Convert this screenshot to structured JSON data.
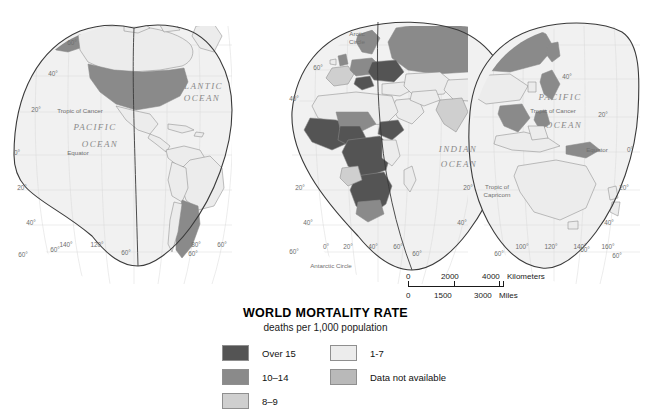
{
  "title": "WORLD MORTALITY RATE",
  "subtitle": "deaths per 1,000 population",
  "legend": {
    "left_column": [
      {
        "label": "Over 15",
        "color": "#545454"
      },
      {
        "label": "10–14",
        "color": "#8a8a8a"
      },
      {
        "label": "8–9",
        "color": "#cfcfcf"
      }
    ],
    "right_column": [
      {
        "label": "1-7",
        "color": "#ececec"
      },
      {
        "label": "Data not available",
        "color": "#b9b9b9"
      }
    ]
  },
  "scale_bar": {
    "km": {
      "ticks": [
        "0",
        "2000",
        "4000"
      ],
      "unit": "Kilometers"
    },
    "mi": {
      "ticks": [
        "0",
        "1500",
        "3000"
      ],
      "unit": "Miles"
    }
  },
  "map": {
    "ocean_color": "#f1f1f1",
    "outline_color": "#3a3a3a",
    "graticule_color": "#d4d4d4",
    "border_color": "#8c8c8c",
    "ocean_labels": [
      {
        "text": "ATLANTIC",
        "x": 197,
        "y": 89
      },
      {
        "text": "OCEAN",
        "x": 202,
        "y": 101
      },
      {
        "text": "PACIFIC",
        "x": 95,
        "y": 130
      },
      {
        "text": "OCEAN",
        "x": 100,
        "y": 147
      },
      {
        "text": "INDIAN",
        "x": 458,
        "y": 152
      },
      {
        "text": "OCEAN",
        "x": 459,
        "y": 167
      },
      {
        "text": "PACIFIC",
        "x": 560,
        "y": 100
      },
      {
        "text": "OCEAN",
        "x": 564,
        "y": 128
      }
    ],
    "reference_lines": [
      {
        "text": "Tropic of Cancer",
        "x": 80,
        "y": 113
      },
      {
        "text": "Equator",
        "x": 78,
        "y": 155
      },
      {
        "text": "Tropic of Cancer",
        "x": 553,
        "y": 113
      },
      {
        "text": "Equator",
        "x": 597,
        "y": 152
      },
      {
        "text": "Tropic of",
        "x": 497,
        "y": 189
      },
      {
        "text": "Capricorn",
        "x": 497,
        "y": 197
      },
      {
        "text": "Arctic",
        "x": 357,
        "y": 36
      },
      {
        "text": "Circle",
        "x": 357,
        "y": 44
      },
      {
        "text": "Antarctic Circle",
        "x": 331,
        "y": 268
      }
    ],
    "latitude_labels": [
      {
        "text": "60°",
        "x": 72,
        "y": 45
      },
      {
        "text": "40°",
        "x": 53,
        "y": 76
      },
      {
        "text": "20°",
        "x": 36,
        "y": 112
      },
      {
        "text": "0°",
        "x": 17,
        "y": 155
      },
      {
        "text": "20°",
        "x": 22,
        "y": 190
      },
      {
        "text": "40°",
        "x": 31,
        "y": 225
      },
      {
        "text": "60°",
        "x": 55,
        "y": 252
      },
      {
        "text": "60°",
        "x": 318,
        "y": 70
      },
      {
        "text": "40°",
        "x": 294,
        "y": 101
      },
      {
        "text": "20°",
        "x": 300,
        "y": 190
      },
      {
        "text": "40°",
        "x": 308,
        "y": 225
      },
      {
        "text": "20°",
        "x": 468,
        "y": 190
      },
      {
        "text": "40°",
        "x": 462,
        "y": 225
      },
      {
        "text": "40°",
        "x": 567,
        "y": 79
      },
      {
        "text": "20°",
        "x": 603,
        "y": 117
      },
      {
        "text": "0°",
        "x": 630,
        "y": 152
      },
      {
        "text": "20°",
        "x": 624,
        "y": 190
      },
      {
        "text": "40°",
        "x": 609,
        "y": 225
      },
      {
        "text": "60°",
        "x": 585,
        "y": 252
      }
    ],
    "longitude_labels": [
      {
        "text": "140°",
        "x": 66,
        "y": 247
      },
      {
        "text": "120°",
        "x": 97,
        "y": 247
      },
      {
        "text": "60°",
        "x": 23,
        "y": 257
      },
      {
        "text": "60°",
        "x": 126,
        "y": 255
      },
      {
        "text": "80°",
        "x": 196,
        "y": 247
      },
      {
        "text": "60°",
        "x": 222,
        "y": 247
      },
      {
        "text": "60°",
        "x": 193,
        "y": 256
      },
      {
        "text": "60°",
        "x": 294,
        "y": 254
      },
      {
        "text": "0°",
        "x": 326,
        "y": 249
      },
      {
        "text": "20°",
        "x": 348,
        "y": 249
      },
      {
        "text": "40°",
        "x": 373,
        "y": 249
      },
      {
        "text": "60°",
        "x": 398,
        "y": 249
      },
      {
        "text": "60°",
        "x": 417,
        "y": 256
      },
      {
        "text": "100°",
        "x": 522,
        "y": 249
      },
      {
        "text": "120°",
        "x": 551,
        "y": 249
      },
      {
        "text": "140°",
        "x": 580,
        "y": 249
      },
      {
        "text": "160°",
        "x": 608,
        "y": 249
      },
      {
        "text": "60°",
        "x": 499,
        "y": 256
      },
      {
        "text": "60°",
        "x": 617,
        "y": 258
      }
    ]
  },
  "chart_data": {
    "type": "map",
    "title": "WORLD MORTALITY RATE",
    "subtitle": "deaths per 1,000 population",
    "projection": "interrupted homolosine",
    "classes": [
      {
        "label": "Over 15",
        "color": "#545454"
      },
      {
        "label": "10–14",
        "color": "#8a8a8a"
      },
      {
        "label": "8–9",
        "color": "#cfcfcf"
      },
      {
        "label": "1-7",
        "color": "#ececec"
      },
      {
        "label": "Data not available",
        "color": "#b9b9b9"
      }
    ],
    "regions": [
      {
        "name": "United States",
        "class": "10–14"
      },
      {
        "name": "Canada",
        "class": "1-7"
      },
      {
        "name": "Alaska",
        "class": "10–14"
      },
      {
        "name": "Mexico",
        "class": "1-7"
      },
      {
        "name": "Central America",
        "class": "1-7"
      },
      {
        "name": "Brazil",
        "class": "1-7"
      },
      {
        "name": "Argentina",
        "class": "8–9"
      },
      {
        "name": "Chile",
        "class": "1-7"
      },
      {
        "name": "Russia",
        "class": "10–14"
      },
      {
        "name": "Scandinavia",
        "class": "10–14"
      },
      {
        "name": "United Kingdom",
        "class": "10–14"
      },
      {
        "name": "Germany",
        "class": "10–14"
      },
      {
        "name": "Eastern Europe",
        "class": "Over 15"
      },
      {
        "name": "France",
        "class": "8–9"
      },
      {
        "name": "Spain",
        "class": "8–9"
      },
      {
        "name": "Northern Africa",
        "class": "1-7"
      },
      {
        "name": "West Africa",
        "class": "Over 15"
      },
      {
        "name": "Central Africa",
        "class": "Over 15"
      },
      {
        "name": "Southern Africa",
        "class": "Over 15"
      },
      {
        "name": "Ethiopia",
        "class": "Over 15"
      },
      {
        "name": "Madagascar",
        "class": "1-7"
      },
      {
        "name": "Middle East",
        "class": "1-7"
      },
      {
        "name": "India",
        "class": "8–9"
      },
      {
        "name": "China",
        "class": "1-7"
      },
      {
        "name": "Japan",
        "class": "8–9"
      },
      {
        "name": "Southeast Asia",
        "class": "8–9"
      },
      {
        "name": "Indonesia",
        "class": "8–9"
      },
      {
        "name": "Australia",
        "class": "1-7"
      },
      {
        "name": "New Zealand",
        "class": "1-7"
      },
      {
        "name": "Papua New Guinea",
        "class": "10–14"
      }
    ]
  }
}
